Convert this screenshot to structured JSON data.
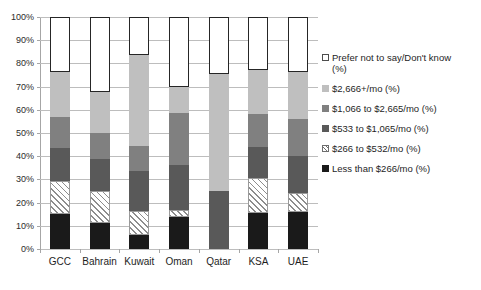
{
  "chart_data": {
    "type": "bar",
    "subtype": "stacked-bar-100-percent",
    "title": "",
    "xlabel": "",
    "ylabel": "",
    "ylim": [
      0,
      100
    ],
    "ytick_labels": [
      "0%",
      "10%",
      "20%",
      "30%",
      "40%",
      "50%",
      "60%",
      "70%",
      "80%",
      "90%",
      "100%"
    ],
    "ytick_values": [
      0,
      10,
      20,
      30,
      40,
      50,
      60,
      70,
      80,
      90,
      100
    ],
    "grid": true,
    "legend_position": "right",
    "categories": [
      "GCC",
      "Bahrain",
      "Kuwait",
      "Oman",
      "Qatar",
      "KSA",
      "UAE"
    ],
    "series": [
      {
        "name": "Less than $266/mo (%)",
        "style": "solid",
        "color": "#1a1a1a",
        "values": [
          15,
          11,
          6,
          14,
          0,
          15.5,
          16
        ]
      },
      {
        "name": "$266 to $532/mo (%)",
        "style": "hatch",
        "color": "#ffffff",
        "values": [
          14.5,
          14,
          10.5,
          3,
          0,
          15,
          8
        ]
      },
      {
        "name": "$533 to $1,065/mo (%)",
        "style": "solid",
        "color": "#595959",
        "values": [
          14,
          14,
          17,
          19,
          25,
          13.5,
          16
        ]
      },
      {
        "name": "$1,066 to $2,665/mo (%)",
        "style": "solid",
        "color": "#808080",
        "values": [
          13.5,
          11,
          11,
          22.5,
          0,
          14,
          16
        ]
      },
      {
        "name": "$2,666+/mo (%)",
        "style": "solid",
        "color": "#bfbfbf",
        "values": [
          19.5,
          17.5,
          39,
          11.5,
          50.5,
          19,
          20.5
        ]
      },
      {
        "name": "Prefer not to say/Don't know\n(%)",
        "style": "outline",
        "color": "#ffffff",
        "values": [
          23.5,
          32.5,
          16.5,
          30,
          24.5,
          23,
          23.5
        ]
      }
    ],
    "legend_entries": [
      {
        "label": "Prefer not to say/Don't know\n(%)",
        "style": "outline",
        "color": "#ffffff"
      },
      {
        "label": "$2,666+/mo (%)",
        "style": "solid",
        "color": "#bfbfbf"
      },
      {
        "label": "$1,066 to $2,665/mo (%)",
        "style": "solid",
        "color": "#808080"
      },
      {
        "label": "$533 to $1,065/mo (%)",
        "style": "solid",
        "color": "#595959"
      },
      {
        "label": "$266 to $532/mo (%)",
        "style": "hatch",
        "color": "#ffffff"
      },
      {
        "label": "Less than $266/mo (%)",
        "style": "solid",
        "color": "#1a1a1a"
      }
    ]
  }
}
